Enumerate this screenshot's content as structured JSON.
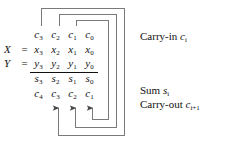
{
  "figure": {
    "type": "ripple-carry-adder-schematic",
    "line_color": "#6b6b6b",
    "text_color": "#111111"
  },
  "operands": {
    "x_label": "X",
    "y_label": "Y",
    "equals": "="
  },
  "rows": {
    "carry_in": {
      "name": "carry-in-row",
      "cells": [
        {
          "sym": "c",
          "sub": "3"
        },
        {
          "sym": "c",
          "sub": "2"
        },
        {
          "sym": "c",
          "sub": "1"
        },
        {
          "sym": "c",
          "sub": "0"
        }
      ]
    },
    "x": {
      "name": "x-operand-row",
      "cells": [
        {
          "sym": "x",
          "sub": "3"
        },
        {
          "sym": "x",
          "sub": "2"
        },
        {
          "sym": "x",
          "sub": "1"
        },
        {
          "sym": "x",
          "sub": "0"
        }
      ]
    },
    "y": {
      "name": "y-operand-row",
      "cells": [
        {
          "sym": "y",
          "sub": "3"
        },
        {
          "sym": "y",
          "sub": "2"
        },
        {
          "sym": "y",
          "sub": "1"
        },
        {
          "sym": "y",
          "sub": "0"
        }
      ]
    },
    "sum": {
      "name": "sum-row",
      "cells": [
        {
          "sym": "s",
          "sub": "3"
        },
        {
          "sym": "s",
          "sub": "2"
        },
        {
          "sym": "s",
          "sub": "1"
        },
        {
          "sym": "s",
          "sub": "0"
        }
      ]
    },
    "carry_out": {
      "name": "carry-out-row",
      "cells": [
        {
          "sym": "c",
          "sub": "4"
        },
        {
          "sym": "c",
          "sub": "3"
        },
        {
          "sym": "c",
          "sub": "2"
        },
        {
          "sym": "c",
          "sub": "1"
        }
      ]
    }
  },
  "annotations": {
    "carry_in": {
      "text": "Carry-in",
      "sym": "c",
      "sub": "i"
    },
    "sum": {
      "text": "Sum",
      "sym": "s",
      "sub": "i"
    },
    "carry_out": {
      "text": "Carry-out",
      "sym": "c",
      "sub": "i+1"
    }
  },
  "wires": {
    "description": "Each carry-out c1, c2, c3 is routed around to the carry-in position of the next more significant column",
    "arrow_targets": [
      "c3",
      "c2",
      "c1"
    ],
    "source_taps": [
      "c3",
      "c2",
      "c1"
    ]
  }
}
